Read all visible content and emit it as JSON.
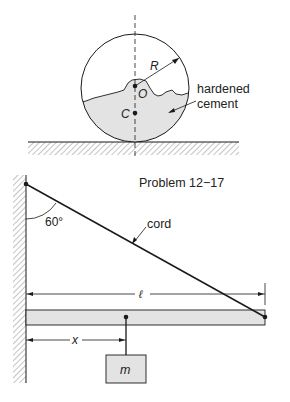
{
  "figure_top": {
    "labels": {
      "radius": "R",
      "center": "O",
      "centroid": "C",
      "cement_line1": "hardened",
      "cement_line2": "cement"
    }
  },
  "figure_bottom": {
    "caption": "Problem 12−17",
    "labels": {
      "angle": "60°",
      "cord": "cord",
      "length": "ℓ",
      "distance": "x",
      "mass": "m"
    }
  },
  "colors": {
    "line": "#1a1a1a",
    "fill": "#e3e3e3",
    "hatch": "#8a8a8a"
  }
}
